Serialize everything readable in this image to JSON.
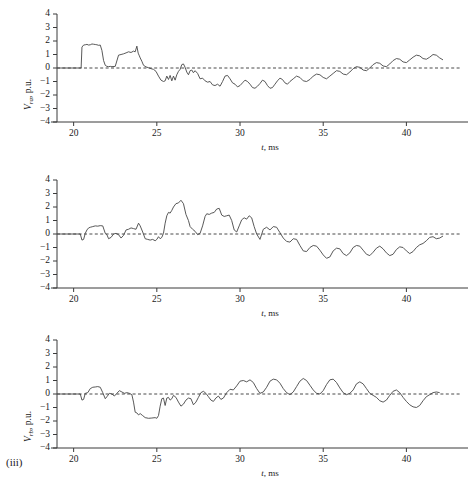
{
  "figure": {
    "index_label": "(iii)",
    "panel_count": 3
  },
  "chart_data": [
    {
      "type": "line",
      "title": "",
      "subtitle": "",
      "xlabel": "t, ms",
      "ylabel": "V_ra, p.u.",
      "ylabel_base": "V",
      "ylabel_sub": "ra",
      "ylabel_unit": ", p.u.",
      "xlim": [
        19.0,
        42.2
      ],
      "ylim": [
        -4,
        4
      ],
      "xticks": [
        20,
        25,
        30,
        35,
        40
      ],
      "xticklabels": [
        "20",
        "25",
        "30",
        "35",
        "40"
      ],
      "yticks": [
        -4,
        -3,
        -2,
        -1,
        0,
        1,
        2,
        3,
        4
      ],
      "yticklabels": [
        "-4",
        "-3",
        "-2",
        "-1",
        "0",
        "1",
        "2",
        "3",
        "4"
      ],
      "grid": false,
      "legend": null,
      "zero_reference_line": true,
      "series": [
        {
          "name": "V_ra",
          "color": "#464646",
          "x": [
            19.0,
            19.3,
            19.6,
            19.9,
            20.2,
            20.45,
            20.5,
            20.6,
            20.7,
            20.8,
            20.9,
            21.0,
            21.1,
            21.2,
            21.3,
            21.4,
            21.5,
            21.6,
            21.7,
            21.8,
            21.9,
            22.0,
            22.1,
            22.2,
            22.3,
            22.5,
            22.7,
            22.85,
            23.0,
            23.15,
            23.3,
            23.45,
            23.6,
            23.7,
            23.8,
            23.88,
            23.95,
            24.0,
            24.1,
            24.2,
            24.35,
            24.5,
            24.65,
            24.8,
            24.95,
            25.1,
            25.25,
            25.4,
            25.5,
            25.6,
            25.7,
            25.8,
            25.9,
            26.0,
            26.1,
            26.2,
            26.3,
            26.4,
            26.5,
            26.6,
            26.7,
            26.8,
            26.9,
            27.0,
            27.1,
            27.2,
            27.3,
            27.45,
            27.6,
            27.75,
            27.9,
            28.05,
            28.2,
            28.35,
            28.5,
            28.65,
            28.8,
            28.95,
            29.1,
            29.25,
            29.4,
            29.55,
            29.7,
            29.85,
            30.0,
            30.15,
            30.3,
            30.45,
            30.6,
            30.75,
            30.9,
            31.05,
            31.2,
            31.35,
            31.5,
            31.65,
            31.8,
            31.95,
            32.1,
            32.25,
            32.4,
            32.55,
            32.7,
            32.85,
            33.0,
            33.2,
            33.4,
            33.6,
            33.8,
            34.0,
            34.2,
            34.4,
            34.6,
            34.8,
            35.0,
            35.2,
            35.4,
            35.6,
            35.8,
            36.0,
            36.2,
            36.4,
            36.6,
            36.8,
            37.0,
            37.2,
            37.4,
            37.6,
            37.8,
            38.0,
            38.2,
            38.4,
            38.6,
            38.8,
            39.0,
            39.2,
            39.4,
            39.6,
            39.8,
            40.0,
            40.2,
            40.4,
            40.6,
            40.8,
            41.0,
            41.2,
            41.4,
            41.6,
            41.8,
            42.0,
            42.2
          ],
          "y": [
            0,
            0,
            0,
            0,
            0,
            0,
            1.55,
            1.7,
            1.72,
            1.75,
            1.7,
            1.72,
            1.78,
            1.76,
            1.74,
            1.72,
            1.68,
            1.7,
            1.3,
            0.55,
            0.2,
            0.12,
            0.1,
            0.12,
            0.1,
            0.12,
            0.95,
            1.0,
            1.05,
            1.12,
            1.2,
            1.15,
            1.25,
            1.2,
            1.62,
            1.1,
            0.9,
            0.75,
            0.5,
            0.2,
            0.08,
            0.02,
            -0.05,
            -0.1,
            -0.25,
            -0.6,
            -0.9,
            -1.0,
            -0.95,
            -0.6,
            -0.85,
            -0.55,
            -0.95,
            -0.6,
            -0.9,
            -0.5,
            -0.25,
            -0.1,
            0.25,
            0.3,
            0.05,
            -0.3,
            -0.5,
            -0.2,
            -0.15,
            -0.35,
            -0.2,
            -0.4,
            -0.8,
            -0.75,
            -0.95,
            -1.05,
            -1.0,
            -1.25,
            -1.3,
            -1.2,
            -1.35,
            -1.0,
            -0.6,
            -0.55,
            -0.8,
            -1.1,
            -1.2,
            -1.4,
            -1.3,
            -1.1,
            -0.9,
            -1.0,
            -1.2,
            -1.45,
            -1.5,
            -1.35,
            -1.15,
            -0.9,
            -1.0,
            -1.3,
            -1.5,
            -1.45,
            -1.2,
            -0.95,
            -0.75,
            -0.85,
            -1.1,
            -1.2,
            -1.0,
            -0.8,
            -0.6,
            -0.7,
            -0.95,
            -1.0,
            -0.85,
            -0.6,
            -0.45,
            -0.5,
            -0.7,
            -0.8,
            -0.6,
            -0.4,
            -0.2,
            -0.25,
            -0.45,
            -0.5,
            -0.3,
            -0.05,
            0.1,
            0.05,
            -0.15,
            -0.2,
            0.0,
            0.25,
            0.4,
            0.35,
            0.15,
            0.1,
            0.3,
            0.55,
            0.7,
            0.65,
            0.45,
            0.4,
            0.6,
            0.8,
            0.95,
            0.9,
            0.7,
            0.65,
            0.8,
            1.0,
            0.95,
            0.75,
            0.6
          ]
        }
      ]
    },
    {
      "type": "line",
      "title": "",
      "subtitle": "",
      "xlabel": "t, ms",
      "ylabel": "V_rb, p.u.",
      "ylabel_base": "V",
      "ylabel_sub": "rb",
      "ylabel_unit": ", p.u.",
      "xlim": [
        19.0,
        42.2
      ],
      "ylim": [
        -4,
        4
      ],
      "xticks": [
        20,
        25,
        30,
        35,
        40
      ],
      "xticklabels": [
        "20",
        "25",
        "30",
        "35",
        "40"
      ],
      "yticks": [
        -4,
        -3,
        -2,
        -1,
        0,
        1,
        2,
        3,
        4
      ],
      "yticklabels": [
        "-4",
        "-3",
        "-2",
        "-1",
        "0",
        "1",
        "2",
        "3",
        "4"
      ],
      "grid": false,
      "legend": null,
      "zero_reference_line": true,
      "series": [
        {
          "name": "V_rb",
          "color": "#464646",
          "x": [
            19.0,
            19.4,
            19.8,
            20.2,
            20.4,
            20.5,
            20.6,
            20.7,
            20.8,
            20.9,
            21.0,
            21.15,
            21.3,
            21.45,
            21.6,
            21.75,
            21.9,
            22.0,
            22.1,
            22.25,
            22.4,
            22.55,
            22.7,
            22.85,
            23.0,
            23.15,
            23.3,
            23.45,
            23.6,
            23.75,
            23.9,
            24.0,
            24.15,
            24.3,
            24.45,
            24.6,
            24.75,
            24.9,
            25.0,
            25.1,
            25.2,
            25.3,
            25.4,
            25.5,
            25.6,
            25.7,
            25.8,
            25.9,
            26.0,
            26.15,
            26.3,
            26.45,
            26.6,
            26.75,
            26.9,
            27.0,
            27.15,
            27.3,
            27.45,
            27.6,
            27.75,
            27.9,
            28.0,
            28.15,
            28.3,
            28.45,
            28.6,
            28.75,
            28.9,
            29.05,
            29.2,
            29.35,
            29.5,
            29.65,
            29.8,
            29.95,
            30.1,
            30.25,
            30.4,
            30.55,
            30.7,
            30.85,
            31.0,
            31.2,
            31.4,
            31.6,
            31.8,
            32.0,
            32.2,
            32.4,
            32.6,
            32.8,
            33.0,
            33.2,
            33.4,
            33.6,
            33.8,
            34.0,
            34.2,
            34.4,
            34.6,
            34.8,
            35.0,
            35.2,
            35.4,
            35.6,
            35.8,
            36.0,
            36.2,
            36.4,
            36.6,
            36.8,
            37.0,
            37.2,
            37.4,
            37.6,
            37.8,
            38.0,
            38.2,
            38.4,
            38.6,
            38.8,
            39.0,
            39.2,
            39.4,
            39.6,
            39.8,
            40.0,
            40.2,
            40.4,
            40.6,
            40.8,
            41.0,
            41.2,
            41.4,
            41.6,
            41.8,
            42.0,
            42.2
          ],
          "y": [
            0,
            0,
            0,
            0,
            0,
            -0.45,
            -0.4,
            0.05,
            0.3,
            0.45,
            0.5,
            0.55,
            0.6,
            0.58,
            0.62,
            0.6,
            0.05,
            -0.05,
            -0.35,
            -0.25,
            0.0,
            0.05,
            -0.05,
            -0.3,
            -0.1,
            0.3,
            0.35,
            0.45,
            0.4,
            0.35,
            0.8,
            0.6,
            0.15,
            -0.35,
            -0.4,
            -0.45,
            -0.4,
            -0.5,
            -0.4,
            -0.2,
            -0.35,
            -0.25,
            0.05,
            0.8,
            1.35,
            1.6,
            1.55,
            1.75,
            2.0,
            2.25,
            2.3,
            2.5,
            2.25,
            1.45,
            1.0,
            0.55,
            0.35,
            0.2,
            -0.05,
            0.05,
            0.6,
            1.3,
            1.5,
            1.45,
            1.55,
            1.6,
            1.85,
            1.9,
            1.4,
            1.3,
            1.35,
            1.4,
            1.0,
            0.3,
            0.15,
            0.6,
            1.05,
            1.2,
            1.1,
            1.35,
            1.2,
            0.55,
            0.0,
            -0.4,
            0.35,
            0.5,
            0.3,
            0.55,
            0.5,
            0.1,
            -0.3,
            -0.55,
            -0.6,
            -0.35,
            -0.4,
            -0.85,
            -1.25,
            -1.3,
            -1.0,
            -0.85,
            -0.9,
            -1.2,
            -1.55,
            -1.8,
            -1.7,
            -1.25,
            -1.05,
            -1.1,
            -1.45,
            -1.6,
            -1.4,
            -1.0,
            -0.85,
            -0.9,
            -1.2,
            -1.5,
            -1.6,
            -1.35,
            -1.05,
            -0.9,
            -1.1,
            -1.4,
            -1.6,
            -1.5,
            -1.15,
            -0.95,
            -1.0,
            -1.25,
            -1.45,
            -1.3,
            -1.0,
            -0.8,
            -0.7,
            -0.5,
            -0.25,
            -0.2,
            -0.35,
            -0.3,
            -0.15,
            -0.2
          ]
        }
      ]
    },
    {
      "type": "line",
      "title": "",
      "subtitle": "",
      "xlabel": "t, ms",
      "ylabel": "V_rc, p.u.",
      "ylabel_base": "V",
      "ylabel_sub": "rc",
      "ylabel_unit": ", p.u.",
      "xlim": [
        19.0,
        42.2
      ],
      "ylim": [
        -4,
        4
      ],
      "xticks": [
        20,
        25,
        30,
        35,
        40
      ],
      "xticklabels": [
        "20",
        "25",
        "30",
        "35",
        "40"
      ],
      "yticks": [
        -4,
        -3,
        -2,
        -1,
        0,
        1,
        2,
        3,
        4
      ],
      "yticklabels": [
        "-4",
        "-3",
        "-2",
        "-1",
        "0",
        "1",
        "2",
        "3",
        "4"
      ],
      "grid": false,
      "legend": null,
      "zero_reference_line": true,
      "series": [
        {
          "name": "V_rc",
          "color": "#464646",
          "x": [
            19.0,
            19.4,
            19.8,
            20.2,
            20.4,
            20.5,
            20.6,
            20.7,
            20.85,
            21.0,
            21.15,
            21.3,
            21.45,
            21.6,
            21.75,
            21.9,
            22.0,
            22.15,
            22.3,
            22.45,
            22.6,
            22.75,
            22.9,
            23.05,
            23.2,
            23.35,
            23.5,
            23.6,
            23.7,
            23.8,
            23.9,
            24.0,
            24.15,
            24.3,
            24.5,
            24.7,
            24.9,
            25.0,
            25.1,
            25.2,
            25.3,
            25.4,
            25.5,
            25.6,
            25.7,
            25.8,
            25.9,
            26.0,
            26.15,
            26.3,
            26.45,
            26.6,
            26.75,
            26.9,
            27.05,
            27.2,
            27.35,
            27.5,
            27.65,
            27.8,
            27.95,
            28.1,
            28.25,
            28.4,
            28.55,
            28.7,
            28.85,
            29.0,
            29.2,
            29.4,
            29.6,
            29.8,
            30.0,
            30.2,
            30.4,
            30.6,
            30.8,
            31.0,
            31.2,
            31.4,
            31.6,
            31.8,
            32.0,
            32.2,
            32.4,
            32.6,
            32.8,
            33.0,
            33.2,
            33.4,
            33.6,
            33.8,
            34.0,
            34.2,
            34.4,
            34.6,
            34.8,
            35.0,
            35.2,
            35.4,
            35.6,
            35.8,
            36.0,
            36.2,
            36.4,
            36.6,
            36.8,
            37.0,
            37.2,
            37.4,
            37.6,
            37.8,
            38.0,
            38.2,
            38.4,
            38.6,
            38.8,
            39.0,
            39.2,
            39.4,
            39.6,
            39.8,
            40.0,
            40.2,
            40.4,
            40.6,
            40.8,
            41.0,
            41.2,
            41.4,
            41.6,
            41.8,
            42.0,
            42.2
          ],
          "y": [
            0,
            0,
            0,
            0,
            0,
            -0.45,
            -0.4,
            0.05,
            0.1,
            0.4,
            0.5,
            0.52,
            0.55,
            0.5,
            0.1,
            -0.35,
            -0.2,
            0.05,
            0.0,
            -0.15,
            0.05,
            0.25,
            0.15,
            0.05,
            0.1,
            0.05,
            -0.05,
            -0.6,
            -1.35,
            -1.4,
            -1.55,
            -1.45,
            -1.6,
            -1.75,
            -1.8,
            -1.78,
            -1.75,
            -1.8,
            -1.6,
            -0.9,
            -0.35,
            -0.3,
            -0.85,
            -0.3,
            -0.25,
            -0.45,
            -0.35,
            -0.1,
            -0.25,
            -0.6,
            -0.9,
            -0.75,
            -0.45,
            -0.3,
            -0.35,
            -0.8,
            -0.6,
            -0.25,
            0.1,
            0.2,
            0.05,
            -0.2,
            -0.45,
            -0.55,
            -0.3,
            -0.15,
            -0.4,
            -0.3,
            0.1,
            0.35,
            0.3,
            0.6,
            0.95,
            1.0,
            0.9,
            1.05,
            0.85,
            0.4,
            0.05,
            0.15,
            0.5,
            0.95,
            1.1,
            1.05,
            0.8,
            0.4,
            0.1,
            -0.05,
            0.15,
            0.55,
            0.95,
            1.15,
            1.0,
            0.65,
            0.3,
            0.05,
            0.0,
            0.25,
            0.7,
            1.05,
            1.1,
            0.85,
            0.45,
            0.1,
            -0.05,
            0.05,
            0.3,
            0.75,
            0.9,
            0.75,
            0.4,
            0.05,
            -0.1,
            -0.25,
            -0.5,
            -0.6,
            -0.45,
            -0.1,
            0.2,
            0.3,
            0.1,
            -0.25,
            -0.55,
            -0.8,
            -0.95,
            -1.0,
            -0.85,
            -0.5,
            -0.2,
            -0.05,
            0.1,
            0.15,
            0.1
          ]
        }
      ]
    }
  ]
}
